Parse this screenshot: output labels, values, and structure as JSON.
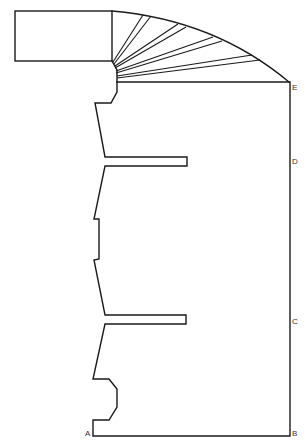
{
  "diagram": {
    "type": "technical-outline",
    "stroke_color": "#1a1a1a",
    "background": "#ffffff",
    "labels": [
      {
        "id": "A",
        "text": "A"
      },
      {
        "id": "B",
        "text": "B"
      },
      {
        "id": "C",
        "text": "C"
      },
      {
        "id": "D",
        "text": "D"
      },
      {
        "id": "E",
        "text": "E"
      }
    ]
  }
}
